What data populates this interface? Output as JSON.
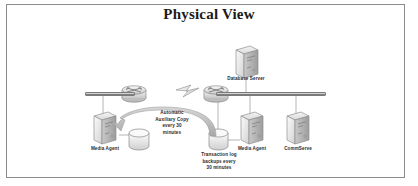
{
  "figure": {
    "title": "Physical View",
    "border_color": "#8c8c8c",
    "background": "#ffffff"
  },
  "nodes": [
    {
      "id": "database-server",
      "label": "Database Server",
      "type": "server"
    },
    {
      "id": "media-agent-left",
      "label": "Media Agent",
      "type": "server"
    },
    {
      "id": "media-agent-right",
      "label": "Media Agent",
      "type": "server"
    },
    {
      "id": "commserve",
      "label": "CommServe",
      "type": "server"
    },
    {
      "id": "storage-left",
      "label": "",
      "type": "disk"
    },
    {
      "id": "storage-right",
      "label": "",
      "type": "disk"
    },
    {
      "id": "router-left",
      "label": "",
      "type": "router"
    },
    {
      "id": "router-right",
      "label": "",
      "type": "router"
    }
  ],
  "annotations": {
    "aux_copy": {
      "line1": "Automatic",
      "line2": "Auxiliary Copy",
      "line3": "every 30",
      "line4": "minutes"
    },
    "txn_log": {
      "line1": "Transaction log",
      "line2": "backups every",
      "line3": "30 minutes"
    }
  },
  "links": {
    "wan": "lightning-bolt"
  }
}
